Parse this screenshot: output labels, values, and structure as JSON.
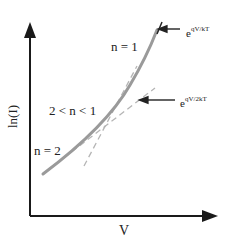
{
  "diagram": {
    "title": "",
    "y_axis_label": "ln(I)",
    "x_axis_label": "V",
    "region_labels": {
      "n1": "n = 1",
      "mid": "2 < n < 1",
      "n2": "n = 2"
    },
    "asymptote_labels": {
      "n1_base": "e",
      "n1_exp": "qV/kT",
      "n2_base": "e",
      "n2_exp": "qV/2kT"
    },
    "colors": {
      "axis": "#1a1a1a",
      "curve": "#9a9a9a",
      "dashed": "#b5b5b5",
      "arrow": "#222222"
    }
  }
}
